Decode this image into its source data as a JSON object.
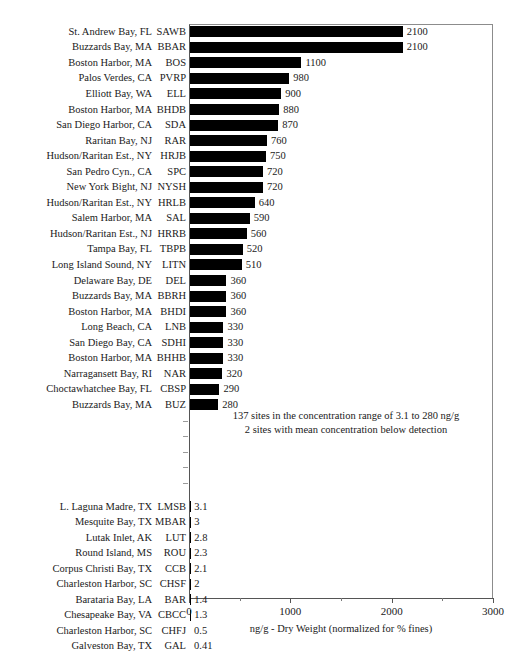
{
  "chart_data": {
    "type": "bar",
    "orientation": "horizontal",
    "title": "",
    "xlabel": "ng/g - Dry Weight (normalized for % fines)",
    "ylabel": "",
    "xlim": [
      0,
      3000
    ],
    "xticks": [
      0,
      1000,
      2000,
      3000
    ],
    "xtick_labels": [
      "0",
      "1000",
      "2000",
      "3000"
    ],
    "xminor_ticks": [
      500,
      1500,
      2500
    ],
    "grid": false,
    "legend": null,
    "bar_color": "#000000",
    "categories": [
      "SAWB",
      "BBAR",
      "BOS",
      "PVRP",
      "ELL",
      "BHDB",
      "SDA",
      "RAR",
      "HRJB",
      "SPC",
      "NYSH",
      "HRLB",
      "SAL",
      "HRRB",
      "TBPB",
      "LITN",
      "DEL",
      "BBRH",
      "BHDI",
      "LNB",
      "SDHI",
      "BHHB",
      "NAR",
      "CBSP",
      "BUZ",
      "LMSB",
      "MBAR",
      "LUT",
      "ROU",
      "CCB",
      "CHSF",
      "BAR",
      "CBCC",
      "CHFJ",
      "GAL"
    ],
    "values": [
      2100,
      2100,
      1100,
      980,
      900,
      880,
      870,
      760,
      750,
      720,
      720,
      640,
      590,
      560,
      520,
      510,
      360,
      360,
      360,
      330,
      330,
      330,
      320,
      290,
      280,
      3.1,
      3,
      2.8,
      2.3,
      2.1,
      2,
      1.4,
      1.3,
      0.5,
      0.41
    ],
    "annotations": [
      "137 sites in the concentration range of 3.1 to 280 ng/g",
      "2 sites with mean concentration below detection"
    ]
  },
  "axis": {
    "xlabel": "ng/g - Dry Weight (normalized for % fines)",
    "ticks": [
      {
        "label": "0",
        "value": 0
      },
      {
        "label": "1000",
        "value": 1000
      },
      {
        "label": "2000",
        "value": 2000
      },
      {
        "label": "3000",
        "value": 3000
      }
    ]
  },
  "annotation": {
    "line1": "137 sites in the concentration range of 3.1 to 280 ng/g",
    "line2": "2 sites with mean concentration below detection"
  },
  "top_rows": [
    {
      "site": "St. Andrew Bay, FL",
      "code": "SAWB",
      "value": "2100"
    },
    {
      "site": "Buzzards Bay, MA",
      "code": "BBAR",
      "value": "2100"
    },
    {
      "site": "Boston Harbor, MA",
      "code": "BOS",
      "value": "1100"
    },
    {
      "site": "Palos Verdes, CA",
      "code": "PVRP",
      "value": "980"
    },
    {
      "site": "Elliott Bay, WA",
      "code": "ELL",
      "value": "900"
    },
    {
      "site": "Boston Harbor, MA",
      "code": "BHDB",
      "value": "880"
    },
    {
      "site": "San Diego Harbor, CA",
      "code": "SDA",
      "value": "870"
    },
    {
      "site": "Raritan Bay, NJ",
      "code": "RAR",
      "value": "760"
    },
    {
      "site": "Hudson/Raritan Est., NY",
      "code": "HRJB",
      "value": "750"
    },
    {
      "site": "San Pedro Cyn., CA",
      "code": "SPC",
      "value": "720"
    },
    {
      "site": "New York Bight, NJ",
      "code": "NYSH",
      "value": "720"
    },
    {
      "site": "Hudson/Raritan Est., NY",
      "code": "HRLB",
      "value": "640"
    },
    {
      "site": "Salem Harbor, MA",
      "code": "SAL",
      "value": "590"
    },
    {
      "site": "Hudson/Raritan Est., NJ",
      "code": "HRRB",
      "value": "560"
    },
    {
      "site": "Tampa Bay, FL",
      "code": "TBPB",
      "value": "520"
    },
    {
      "site": "Long Island Sound, NY",
      "code": "LITN",
      "value": "510"
    },
    {
      "site": "Delaware Bay, DE",
      "code": "DEL",
      "value": "360"
    },
    {
      "site": "Buzzards Bay, MA",
      "code": "BBRH",
      "value": "360"
    },
    {
      "site": "Boston Harbor, MA",
      "code": "BHDI",
      "value": "360"
    },
    {
      "site": "Long Beach, CA",
      "code": "LNB",
      "value": "330"
    },
    {
      "site": "San Diego Bay, CA",
      "code": "SDHI",
      "value": "330"
    },
    {
      "site": "Boston Harbor, MA",
      "code": "BHHB",
      "value": "330"
    },
    {
      "site": "Narragansett Bay, RI",
      "code": "NAR",
      "value": "320"
    },
    {
      "site": "Choctawhatchee Bay, FL",
      "code": "CBSP",
      "value": "290"
    },
    {
      "site": "Buzzards Bay, MA",
      "code": "BUZ",
      "value": "280"
    }
  ],
  "bottom_rows": [
    {
      "site": "L. Laguna Madre, TX",
      "code": "LMSB",
      "value": "3.1"
    },
    {
      "site": "Mesquite Bay, TX",
      "code": "MBAR",
      "value": "3"
    },
    {
      "site": "Lutak Inlet, AK",
      "code": "LUT",
      "value": "2.8"
    },
    {
      "site": "Round Island, MS",
      "code": "ROU",
      "value": "2.3"
    },
    {
      "site": "Corpus Christi Bay, TX",
      "code": "CCB",
      "value": "2.1"
    },
    {
      "site": "Charleston Harbor, SC",
      "code": "CHSF",
      "value": "2"
    },
    {
      "site": "Barataria Bay, LA",
      "code": "BAR",
      "value": "1.4"
    },
    {
      "site": "Chesapeake Bay, VA",
      "code": "CBCC",
      "value": "1.3"
    },
    {
      "site": "Charleston Harbor, SC",
      "code": "CHFJ",
      "value": "0.5"
    },
    {
      "site": "Galveston Bay, TX",
      "code": "GAL",
      "value": "0.41"
    }
  ]
}
